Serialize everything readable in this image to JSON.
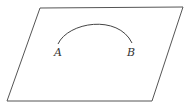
{
  "diagram": {
    "type": "geometry",
    "plane": {
      "shape": "parallelogram",
      "points": "40,8 183,7 152,101 7,101",
      "stroke": "#555555"
    },
    "arc": {
      "path": "M 58 44 C 68 22, 118 14, 132 43",
      "stroke": "#444444"
    },
    "labels": [
      {
        "id": "A",
        "text": "A",
        "x": 54,
        "y": 56
      },
      {
        "id": "B",
        "text": "B",
        "x": 127,
        "y": 56
      }
    ]
  }
}
